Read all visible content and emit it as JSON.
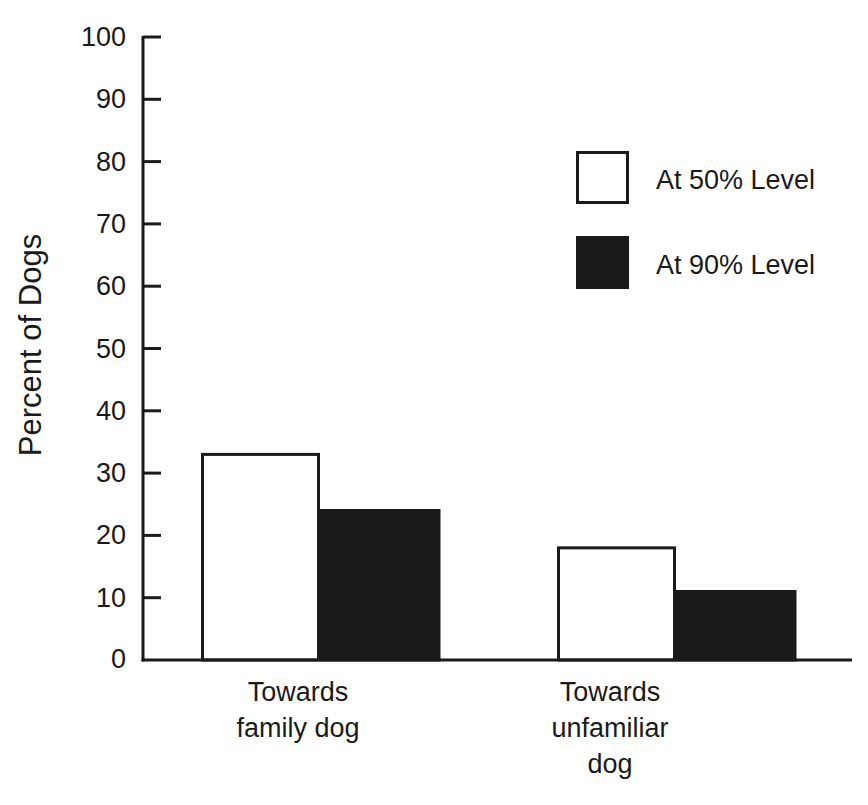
{
  "chart_data": {
    "type": "bar",
    "title": "",
    "xlabel": "",
    "ylabel": "Percent of Dogs",
    "ylim": [
      0,
      100
    ],
    "yticks": [
      0,
      10,
      20,
      30,
      40,
      50,
      60,
      70,
      80,
      90,
      100
    ],
    "grid": false,
    "legend_position": "upper right",
    "categories": [
      "Towards\nfamily dog",
      "Towards\nunfamiliar\ndog"
    ],
    "series": [
      {
        "name": "At 50% Level",
        "color": "#ffffff",
        "edge": "#1a1a1a",
        "values": [
          33,
          18
        ]
      },
      {
        "name": "At 90% Level",
        "color": "#1a1a1a",
        "edge": "#1a1a1a",
        "values": [
          24,
          11
        ]
      }
    ]
  },
  "legend": {
    "items": [
      {
        "label": "At 50% Level"
      },
      {
        "label": "At 90% Level"
      }
    ]
  },
  "axes": {
    "y_title": "Percent of Dogs",
    "y_ticks": [
      "0",
      "10",
      "20",
      "30",
      "40",
      "50",
      "60",
      "70",
      "80",
      "90",
      "100"
    ],
    "x_labels": [
      "Towards\nfamily dog",
      "Towards\nunfamiliar\ndog"
    ]
  }
}
